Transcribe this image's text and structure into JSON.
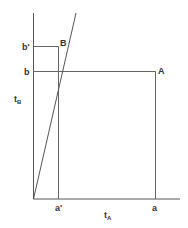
{
  "diagram": {
    "colors": {
      "line": "#555555",
      "text": "#333333",
      "background": "#ffffff"
    },
    "labels": {
      "y_axis": "t",
      "y_axis_sub": "B",
      "x_axis": "t",
      "x_axis_sub": "A",
      "b_prime": "b'",
      "b": "b",
      "a_prime": "a'",
      "a": "a",
      "point_A": "A",
      "point_B": "B"
    }
  }
}
